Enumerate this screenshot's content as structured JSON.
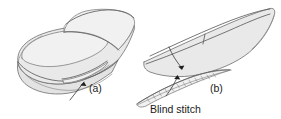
{
  "figure": {
    "name": "blind-stitch-shoe-construction-diagram",
    "background_color": "#ffffff",
    "width": 281,
    "height": 119,
    "panels": [
      {
        "id": "a",
        "label": "(a)",
        "description": "Perspective view of shoe upper and sole"
      },
      {
        "id": "b",
        "label": "(b)",
        "description": "Close-up side view of sole edge showing stitch"
      }
    ],
    "annotations": [
      {
        "id": "blind-stitch",
        "text": "Blind stitch"
      }
    ],
    "colors": {
      "body_fill": "#e9e9e9",
      "light_fill": "#f1f1f1",
      "mid_fill": "#e3e3e3",
      "outline": "#6d6d6d",
      "seam": "#5e5e5e",
      "arrow": "#1d1d1d",
      "text": "#1a1a1a"
    }
  }
}
